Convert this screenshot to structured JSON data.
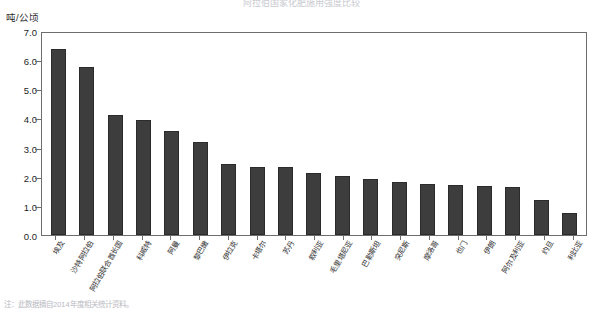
{
  "title_strip": "阿拉伯国家化肥施用强度比较",
  "footnote": "注：此数据摘自2014年度相关统计资料。",
  "chart_data": {
    "type": "bar",
    "title": "",
    "xlabel": "",
    "ylabel": "吨/公顷",
    "ylim": [
      0.0,
      7.0
    ],
    "ytick_labels": [
      "0.0",
      "1.0",
      "2.0",
      "3.0",
      "4.0",
      "5.0",
      "6.0",
      "7.0"
    ],
    "ytick_values": [
      0.0,
      1.0,
      2.0,
      3.0,
      4.0,
      5.0,
      6.0,
      7.0
    ],
    "grid": false,
    "legend": "none",
    "bar_color": "#3d3d3d",
    "categories": [
      "埃及",
      "沙特阿拉伯",
      "阿拉伯联合酋长国",
      "科威特",
      "阿曼",
      "黎巴嫩",
      "伊拉克",
      "卡塔尔",
      "苏丹",
      "叙利亚",
      "毛里塔尼亚",
      "巴勒斯坦",
      "突尼斯",
      "摩洛哥",
      "也门",
      "伊朗",
      "阿尔及利亚",
      "约旦",
      "利比亚"
    ],
    "values": [
      6.45,
      5.82,
      4.17,
      3.97,
      3.6,
      3.22,
      2.45,
      2.34,
      2.34,
      2.15,
      2.05,
      1.95,
      1.83,
      1.78,
      1.75,
      1.7,
      1.67,
      1.22,
      0.78
    ]
  }
}
